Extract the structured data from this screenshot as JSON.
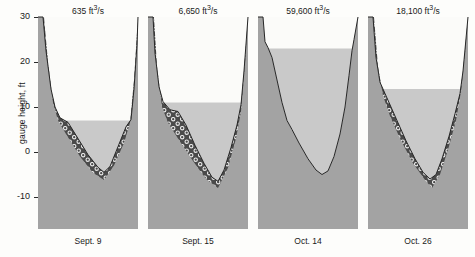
{
  "figure": {
    "axis_title": "gauge height, ft",
    "y_ticks": [
      {
        "value": 30,
        "label": "30"
      },
      {
        "value": 20,
        "label": "20"
      },
      {
        "value": 10,
        "label": "10"
      },
      {
        "value": 0,
        "label": "0"
      },
      {
        "value": -10,
        "label": "-10"
      }
    ],
    "colors": {
      "bank": "#a3a3a3",
      "water": "#c9c9c9",
      "air": "#fbfbf9",
      "gravel_fill": "#4a4a4a",
      "gravel_clast": "#e8e8e8",
      "outline": "#262626",
      "text": "#1a1a1a"
    }
  },
  "chart_data": {
    "type": "area",
    "title": "",
    "xlabel": "",
    "ylabel": "gauge height, ft",
    "ylim": [
      -10,
      30
    ],
    "grid": false,
    "legend": "none",
    "units": {
      "discharge": "ft3/s",
      "elevation": "ft"
    },
    "panels": [
      {
        "date": "Sept. 9",
        "discharge_value": "635",
        "discharge_units_prefix": "ft",
        "discharge_units_exp": "3",
        "discharge_units_suffix": "/s",
        "discharge_label": "635 ft3/s",
        "water_surface_ft": 7,
        "bed_min_ft": -4.5,
        "has_gravel": true,
        "bed_profile": [
          {
            "x": 0.0,
            "y": 30.0
          },
          {
            "x": 0.05,
            "y": 30.0
          },
          {
            "x": 0.08,
            "y": 22.5
          },
          {
            "x": 0.13,
            "y": 14.0
          },
          {
            "x": 0.17,
            "y": 10.0
          },
          {
            "x": 0.22,
            "y": 7.6
          },
          {
            "x": 0.3,
            "y": 6.6
          },
          {
            "x": 0.4,
            "y": 3.0
          },
          {
            "x": 0.5,
            "y": -0.6
          },
          {
            "x": 0.6,
            "y": -3.4
          },
          {
            "x": 0.66,
            "y": -4.5
          },
          {
            "x": 0.72,
            "y": -3.2
          },
          {
            "x": 0.8,
            "y": 1.2
          },
          {
            "x": 0.88,
            "y": 5.6
          },
          {
            "x": 0.93,
            "y": 7.2
          },
          {
            "x": 0.96,
            "y": 14.0
          },
          {
            "x": 0.99,
            "y": 24.0
          },
          {
            "x": 1.0,
            "y": 30.0
          }
        ],
        "bedrock_profile": [
          {
            "x": 0.0,
            "y": 30.0
          },
          {
            "x": 0.06,
            "y": 30.0
          },
          {
            "x": 0.1,
            "y": 20.0
          },
          {
            "x": 0.15,
            "y": 11.0
          },
          {
            "x": 0.2,
            "y": 7.0
          },
          {
            "x": 0.28,
            "y": 4.0
          },
          {
            "x": 0.42,
            "y": -1.0
          },
          {
            "x": 0.55,
            "y": -4.6
          },
          {
            "x": 0.66,
            "y": -6.2
          },
          {
            "x": 0.76,
            "y": -3.0
          },
          {
            "x": 0.86,
            "y": 2.0
          },
          {
            "x": 0.92,
            "y": 6.5
          },
          {
            "x": 0.96,
            "y": 16.0
          },
          {
            "x": 1.0,
            "y": 30.0
          }
        ]
      },
      {
        "date": "Sept. 15",
        "discharge_value": "6,650",
        "discharge_units_prefix": "ft",
        "discharge_units_exp": "3",
        "discharge_units_suffix": "/s",
        "discharge_label": "6,650 ft3/s",
        "water_surface_ft": 11,
        "bed_min_ft": -6.5,
        "has_gravel": true,
        "bed_profile": [
          {
            "x": 0.0,
            "y": 30.0
          },
          {
            "x": 0.05,
            "y": 30.0
          },
          {
            "x": 0.07,
            "y": 22.0
          },
          {
            "x": 0.11,
            "y": 14.5
          },
          {
            "x": 0.15,
            "y": 11.2
          },
          {
            "x": 0.22,
            "y": 9.4
          },
          {
            "x": 0.3,
            "y": 9.0
          },
          {
            "x": 0.38,
            "y": 6.0
          },
          {
            "x": 0.47,
            "y": 1.5
          },
          {
            "x": 0.56,
            "y": -2.5
          },
          {
            "x": 0.64,
            "y": -5.6
          },
          {
            "x": 0.7,
            "y": -6.5
          },
          {
            "x": 0.76,
            "y": -4.0
          },
          {
            "x": 0.83,
            "y": 1.0
          },
          {
            "x": 0.89,
            "y": 6.0
          },
          {
            "x": 0.93,
            "y": 10.5
          },
          {
            "x": 0.96,
            "y": 18.0
          },
          {
            "x": 1.0,
            "y": 30.0
          }
        ],
        "bedrock_profile": [
          {
            "x": 0.0,
            "y": 30.0
          },
          {
            "x": 0.06,
            "y": 30.0
          },
          {
            "x": 0.09,
            "y": 19.0
          },
          {
            "x": 0.14,
            "y": 10.0
          },
          {
            "x": 0.2,
            "y": 6.5
          },
          {
            "x": 0.3,
            "y": 3.0
          },
          {
            "x": 0.45,
            "y": -2.0
          },
          {
            "x": 0.58,
            "y": -6.0
          },
          {
            "x": 0.7,
            "y": -8.0
          },
          {
            "x": 0.8,
            "y": -3.5
          },
          {
            "x": 0.88,
            "y": 3.0
          },
          {
            "x": 0.93,
            "y": 9.0
          },
          {
            "x": 0.97,
            "y": 20.0
          },
          {
            "x": 1.0,
            "y": 30.0
          }
        ]
      },
      {
        "date": "Oct. 14",
        "discharge_value": "59,600",
        "discharge_units_prefix": "ft",
        "discharge_units_exp": "3",
        "discharge_units_suffix": "/s",
        "discharge_label": "59,600 ft3/s",
        "water_surface_ft": 23,
        "bed_min_ft": -5.0,
        "has_gravel": false,
        "bed_profile": [
          {
            "x": 0.0,
            "y": 30.0
          },
          {
            "x": 0.05,
            "y": 30.0
          },
          {
            "x": 0.07,
            "y": 24.5
          },
          {
            "x": 0.1,
            "y": 23.2
          },
          {
            "x": 0.14,
            "y": 21.0
          },
          {
            "x": 0.19,
            "y": 16.0
          },
          {
            "x": 0.24,
            "y": 11.0
          },
          {
            "x": 0.29,
            "y": 7.0
          },
          {
            "x": 0.34,
            "y": 5.0
          },
          {
            "x": 0.41,
            "y": 2.0
          },
          {
            "x": 0.5,
            "y": -1.5
          },
          {
            "x": 0.58,
            "y": -4.0
          },
          {
            "x": 0.64,
            "y": -5.0
          },
          {
            "x": 0.7,
            "y": -4.2
          },
          {
            "x": 0.76,
            "y": -1.0
          },
          {
            "x": 0.82,
            "y": 4.0
          },
          {
            "x": 0.87,
            "y": 10.0
          },
          {
            "x": 0.91,
            "y": 17.0
          },
          {
            "x": 0.94,
            "y": 22.5
          },
          {
            "x": 0.96,
            "y": 25.0
          },
          {
            "x": 1.0,
            "y": 30.0
          }
        ],
        "bedrock_profile": []
      },
      {
        "date": "Oct. 26",
        "discharge_value": "18,100",
        "discharge_units_prefix": "ft",
        "discharge_units_exp": "3",
        "discharge_units_suffix": "/s",
        "discharge_label": "18,100 ft3/s",
        "water_surface_ft": 14,
        "bed_min_ft": -6.0,
        "has_gravel": true,
        "bed_profile": [
          {
            "x": 0.0,
            "y": 30.0
          },
          {
            "x": 0.05,
            "y": 30.0
          },
          {
            "x": 0.08,
            "y": 21.0
          },
          {
            "x": 0.12,
            "y": 15.5
          },
          {
            "x": 0.17,
            "y": 13.0
          },
          {
            "x": 0.23,
            "y": 10.0
          },
          {
            "x": 0.3,
            "y": 6.5
          },
          {
            "x": 0.38,
            "y": 2.5
          },
          {
            "x": 0.47,
            "y": -1.5
          },
          {
            "x": 0.55,
            "y": -4.5
          },
          {
            "x": 0.62,
            "y": -6.0
          },
          {
            "x": 0.68,
            "y": -5.0
          },
          {
            "x": 0.74,
            "y": -1.5
          },
          {
            "x": 0.81,
            "y": 3.5
          },
          {
            "x": 0.87,
            "y": 8.5
          },
          {
            "x": 0.92,
            "y": 13.0
          },
          {
            "x": 0.95,
            "y": 18.0
          },
          {
            "x": 1.0,
            "y": 30.0
          }
        ],
        "bedrock_profile": [
          {
            "x": 0.0,
            "y": 30.0
          },
          {
            "x": 0.06,
            "y": 30.0
          },
          {
            "x": 0.1,
            "y": 19.0
          },
          {
            "x": 0.15,
            "y": 12.5
          },
          {
            "x": 0.22,
            "y": 8.0
          },
          {
            "x": 0.32,
            "y": 3.0
          },
          {
            "x": 0.45,
            "y": -2.5
          },
          {
            "x": 0.58,
            "y": -6.5
          },
          {
            "x": 0.64,
            "y": -8.0
          },
          {
            "x": 0.72,
            "y": -5.0
          },
          {
            "x": 0.8,
            "y": 0.5
          },
          {
            "x": 0.88,
            "y": 7.0
          },
          {
            "x": 0.93,
            "y": 13.5
          },
          {
            "x": 0.97,
            "y": 22.0
          },
          {
            "x": 1.0,
            "y": 30.0
          }
        ]
      }
    ]
  }
}
